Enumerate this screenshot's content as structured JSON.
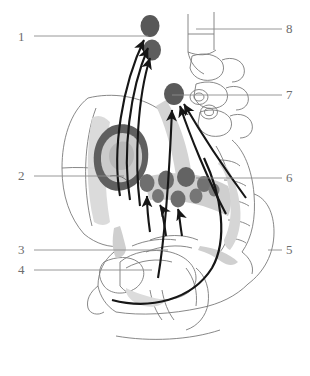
{
  "figure": {
    "type": "anatomical-diagram",
    "title": "",
    "view": "sagittal pelvis with lymphatic drainage pathways",
    "background_color": "#ffffff",
    "label_color": "#6d6d6d",
    "leader_line_color": "#8c8c8c",
    "outline_color": "#7a7a7a",
    "node_dark_color": "#595959",
    "node_mid_color": "#7d7d7d",
    "tissue_fill_color": "#d4d4d4",
    "arrow_color": "#161616"
  },
  "labels": [
    {
      "id": "1",
      "text": "1",
      "side": "left",
      "leader": "long"
    },
    {
      "id": "2",
      "text": "2",
      "side": "left",
      "leader": "long"
    },
    {
      "id": "3",
      "text": "3",
      "side": "left",
      "leader": "long"
    },
    {
      "id": "4",
      "text": "4",
      "side": "left",
      "leader": "long"
    },
    {
      "id": "5",
      "text": "5",
      "side": "right",
      "leader": "short"
    },
    {
      "id": "6",
      "text": "6",
      "side": "right",
      "leader": "long"
    },
    {
      "id": "7",
      "text": "7",
      "side": "right",
      "leader": "long"
    },
    {
      "id": "8",
      "text": "8",
      "side": "right",
      "leader": "long"
    }
  ],
  "lymph_nodes": {
    "count": 11,
    "groups": [
      {
        "name": "para-aortic-upper",
        "shade": "dark",
        "count": 2
      },
      {
        "name": "common-iliac",
        "shade": "dark",
        "count": 1
      },
      {
        "name": "internal-external-iliac-cluster",
        "shade": "mid",
        "count": 6
      },
      {
        "name": "obturator",
        "shade": "mid",
        "count": 2
      }
    ]
  },
  "arrows": {
    "count": 9,
    "description": "curved drainage arrows ascending toward para-aortic and iliac nodes"
  }
}
